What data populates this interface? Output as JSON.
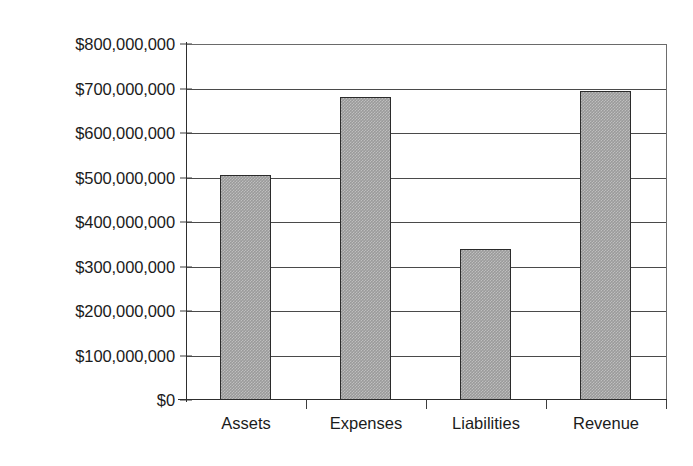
{
  "chart_data": {
    "type": "bar",
    "title": "",
    "subtitle": "",
    "xlabel": "",
    "ylabel": "",
    "categories": [
      "Assets",
      "Expenses",
      "Liabilities",
      "Revenue"
    ],
    "values": [
      505000000,
      680000000,
      340000000,
      695000000
    ],
    "ylim": [
      0,
      800000000
    ],
    "ytick_values": [
      0,
      100000000,
      200000000,
      300000000,
      400000000,
      500000000,
      600000000,
      700000000,
      800000000
    ],
    "ytick_labels": [
      "$0",
      "$100,000,000",
      "$200,000,000",
      "$300,000,000",
      "$400,000,000",
      "$500,000,000",
      "$600,000,000",
      "$700,000,000",
      "$800,000,000"
    ],
    "grid": true,
    "grid_axis": "y",
    "legend": false,
    "legend_position": "none",
    "bar_fill_color": "#9a9a9a",
    "bar_border_color": "#2b2b2b",
    "axis_color": "#2e2e2e",
    "grid_color": "#4a4a4a",
    "background_color": "#ffffff",
    "text_color": "#1b1b1b"
  }
}
